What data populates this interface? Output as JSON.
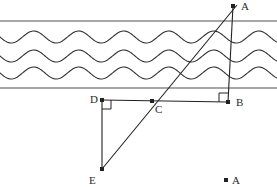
{
  "figure": {
    "type": "geometry-diagram",
    "width": 277,
    "height": 187,
    "background_color": "#ffffff",
    "line_color": "#222222",
    "boundary_color": "#8a8a8a",
    "wave_color": "#333333",
    "label_color": "#2b2b2b"
  },
  "labels": {
    "A": "A",
    "B": "B",
    "C": "C",
    "D": "D",
    "E": "E",
    "A2": "A"
  },
  "points": [
    {
      "name": "A",
      "label": "A",
      "x": 233,
      "y": 6,
      "label_x": 241,
      "label_y": 10,
      "dot": true
    },
    {
      "name": "B",
      "label": "B",
      "x": 228,
      "y": 102,
      "label_x": 236,
      "label_y": 106,
      "dot": true
    },
    {
      "name": "C",
      "label": "C",
      "x": 152,
      "y": 101,
      "label_x": 155,
      "label_y": 113,
      "dot": true
    },
    {
      "name": "D",
      "label": "D",
      "x": 102,
      "y": 100,
      "label_x": 90,
      "label_y": 103,
      "dot": true
    },
    {
      "name": "E",
      "label": "E",
      "x": 102,
      "y": 169,
      "label_x": 89,
      "label_y": 184,
      "dot": true
    },
    {
      "name": "A2",
      "label": "A",
      "x": 226,
      "y": 180,
      "label_x": 232,
      "label_y": 184,
      "dot": true
    }
  ],
  "segments": [
    {
      "name": "segment-AB",
      "from": "A",
      "to": "B",
      "x1": 233,
      "y1": 6,
      "x2": 228,
      "y2": 102
    },
    {
      "name": "segment-AE",
      "from": "A",
      "to": "E",
      "x1": 237,
      "y1": 5,
      "x2": 102,
      "y2": 169
    },
    {
      "name": "segment-DB",
      "from": "D",
      "to": "B",
      "x1": 102,
      "y1": 100,
      "x2": 228,
      "y2": 102
    },
    {
      "name": "segment-DE",
      "from": "D",
      "to": "E",
      "x1": 102,
      "y1": 100,
      "x2": 102,
      "y2": 169
    }
  ],
  "right_angles": [
    {
      "name": "right-angle-at-D",
      "at": "D",
      "x": 102,
      "y": 100,
      "size": 9,
      "dx": 1,
      "dy": 1
    },
    {
      "name": "right-angle-at-B",
      "at": "B",
      "x": 228,
      "y": 102,
      "size": 9,
      "dx": -1,
      "dy": -1
    }
  ],
  "boundaries": [
    {
      "name": "boundary-line-top",
      "y": 21,
      "x1": 0,
      "x2": 277
    },
    {
      "name": "boundary-line-bottom",
      "y": 88,
      "x1": 0,
      "x2": 277
    }
  ],
  "waves": {
    "count": 3,
    "baselines": [
      37,
      56,
      73
    ],
    "amplitude": 6,
    "wavelength": 45,
    "phase": 0,
    "x_start": 0,
    "x_end": 277,
    "stroke_width": 1.1
  }
}
